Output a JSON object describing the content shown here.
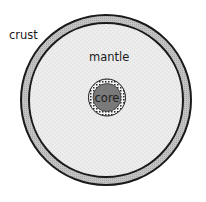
{
  "diagram": {
    "labels": {
      "crust": "crust",
      "mantle": "mantle",
      "core": "core"
    },
    "colors": {
      "crust_fill": "#b8b8b8",
      "mantle_fill": "#ececec",
      "core_fill": "#7a7a7a",
      "outline": "#1a1a1a",
      "core_ring": "#f2f2f2"
    }
  }
}
